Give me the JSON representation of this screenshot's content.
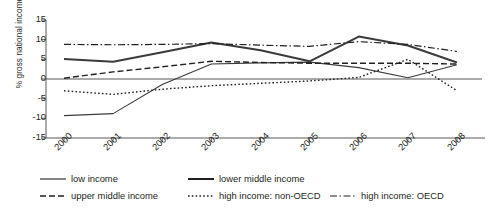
{
  "chart_data": {
    "type": "line",
    "title": "",
    "xlabel": "",
    "ylabel": "% gross national income",
    "categories": [
      "2000",
      "2001",
      "2002",
      "2003",
      "2004",
      "2005",
      "2006",
      "2007",
      "2008"
    ],
    "x": [
      2000,
      2001,
      2002,
      2003,
      2004,
      2005,
      2006,
      2007,
      2008
    ],
    "ylim": [
      -15,
      15
    ],
    "yticks": [
      "15",
      "10",
      "5",
      "0",
      "-5",
      "-10",
      "-15"
    ],
    "ytick_values": [
      15,
      10,
      5,
      0,
      -5,
      -10,
      -15
    ],
    "grid": false,
    "legend_position": "bottom",
    "series": [
      {
        "name": "low income",
        "style": "solid-thin",
        "color": "#3b3b3b",
        "values": [
          -9.3,
          -8.8,
          -1.4,
          3.8,
          4.1,
          4.3,
          2.9,
          0.3,
          3.6
        ]
      },
      {
        "name": "lower middle income",
        "style": "solid-thick",
        "color": "#3b3b3b",
        "values": [
          5.1,
          4.4,
          6.8,
          9.3,
          7.3,
          4.5,
          10.8,
          8.5,
          4.2
        ]
      },
      {
        "name": "upper middle income",
        "style": "dashed",
        "color": "#231f20",
        "values": [
          0.2,
          1.8,
          3.1,
          4.5,
          4.2,
          4.0,
          4.0,
          4.0,
          3.8
        ]
      },
      {
        "name": "high income: non-OECD",
        "style": "dotted",
        "color": "#231f20",
        "values": [
          -3.0,
          -3.9,
          -2.6,
          -1.7,
          -1.1,
          -0.5,
          0.4,
          5.0,
          -3.0
        ]
      },
      {
        "name": "high income: OECD",
        "style": "dash-dot",
        "color": "#231f20",
        "values": [
          8.8,
          8.7,
          8.8,
          9.0,
          8.6,
          8.3,
          9.5,
          8.8,
          7.0
        ]
      }
    ]
  },
  "axis": {
    "y_label": "% gross national income"
  },
  "legend": {
    "items": [
      {
        "label": "low income",
        "style": "solid-thin"
      },
      {
        "label": "lower middle income",
        "style": "solid-thick"
      },
      {
        "label": "upper middle income",
        "style": "dashed"
      },
      {
        "label": "high income: non-OECD",
        "style": "dotted"
      },
      {
        "label": "high income: OECD",
        "style": "dash-dot"
      }
    ]
  }
}
